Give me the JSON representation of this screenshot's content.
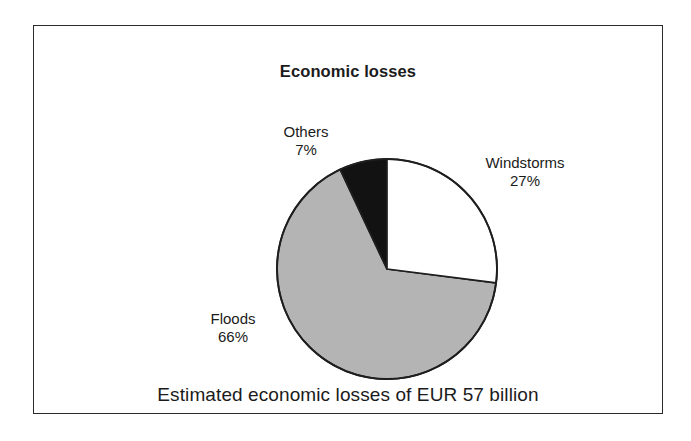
{
  "figure": {
    "title": "Economic losses",
    "caption": "Estimated  economic  losses of EUR 57 billion",
    "frame_color": "#2b2b2b",
    "background_color": "#ffffff"
  },
  "labels": {
    "others": {
      "name": "Others",
      "percent": "7%"
    },
    "windstorms": {
      "name": "Windstorms",
      "percent": "27%"
    },
    "floods": {
      "name": "Floods",
      "percent": "66%"
    }
  },
  "chart_data": {
    "type": "pie",
    "title": "Economic losses",
    "subtitle": "Estimated  economic  losses of EUR 57 billion",
    "categories": [
      "Windstorms",
      "Floods",
      "Others"
    ],
    "values": [
      27,
      66,
      7
    ],
    "value_unit": "percent",
    "data_labels": [
      "27%",
      "66%",
      "7%"
    ],
    "colors": [
      "#ffffff",
      "#b4b4b4",
      "#121212"
    ],
    "slice_outline_color": "#1e1e1e",
    "start_angle_deg": 0,
    "direction": "clockwise",
    "legend": "none",
    "grid": false,
    "total_label": "EUR 57 billion",
    "slices": [
      {
        "label": "Windstorms",
        "value": 27,
        "data_label": "27%",
        "color": "#ffffff",
        "start_deg": 0,
        "end_deg": 97.2
      },
      {
        "label": "Floods",
        "value": 66,
        "data_label": "66%",
        "color": "#b4b4b4",
        "start_deg": 97.2,
        "end_deg": 334.8
      },
      {
        "label": "Others",
        "value": 7,
        "data_label": "7%",
        "color": "#121212",
        "start_deg": 334.8,
        "end_deg": 360
      }
    ]
  }
}
